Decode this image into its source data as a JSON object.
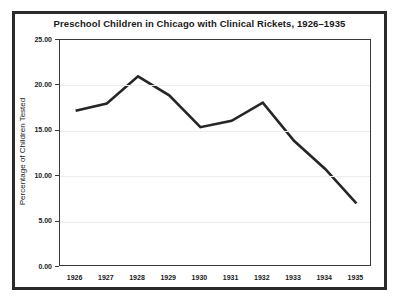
{
  "chart_data": {
    "type": "line",
    "title": "Preschool Children in Chicago with Clinical Rickets, 1926–1935",
    "xlabel": "",
    "ylabel": "Percentage of Children Tested",
    "categories": [
      "1926",
      "1927",
      "1928",
      "1929",
      "1930",
      "1931",
      "1932",
      "1933",
      "1934",
      "1935"
    ],
    "values": [
      17.2,
      18.0,
      21.0,
      18.9,
      15.4,
      16.1,
      18.1,
      13.9,
      10.8,
      7.0
    ],
    "series": [
      {
        "name": "Percentage of Children Tested",
        "values": [
          17.2,
          18.0,
          21.0,
          18.9,
          15.4,
          16.1,
          18.1,
          13.9,
          10.8,
          7.0
        ]
      }
    ],
    "ylim": [
      0.0,
      25.0
    ],
    "ytick_labels": [
      "0.00",
      "5.00",
      "10.00",
      "15.00",
      "20.00",
      "25.00"
    ],
    "ytick_values": [
      0.0,
      5.0,
      10.0,
      15.0,
      20.0,
      25.0
    ],
    "xtick_labels": [
      "1926",
      "1927",
      "1928",
      "1929",
      "1930",
      "1931",
      "1932",
      "1933",
      "1934",
      "1935"
    ],
    "grid": true,
    "legend": false,
    "line_color": "#262626",
    "grid_color": "#ececec",
    "axis_color": "#3a3a3a",
    "background": "#ffffff"
  }
}
